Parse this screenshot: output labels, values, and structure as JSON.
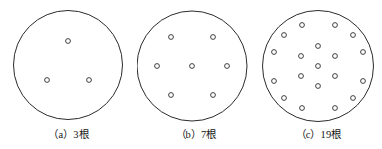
{
  "figure": {
    "background_color": "#ffffff",
    "stroke_color": "#2b2b2b",
    "text_color": "#161616",
    "panels": [
      {
        "id": "panel-a",
        "caption": "（a）3根",
        "label": "a",
        "count_text": "3根",
        "rod_count": 3,
        "circle": {
          "cx": 68,
          "cy": 65,
          "r": 54.5
        },
        "dot_radius": 2.4,
        "dots": [
          {
            "cx": 68,
            "cy": 41
          },
          {
            "cx": 47,
            "cy": 80
          },
          {
            "cx": 89,
            "cy": 80
          }
        ]
      },
      {
        "id": "panel-b",
        "caption": "（b）7根",
        "label": "b",
        "count_text": "7根",
        "rod_count": 7,
        "circle": {
          "cx": 192,
          "cy": 66,
          "r": 55
        },
        "dot_radius": 2.4,
        "dots": [
          {
            "cx": 192,
            "cy": 66
          },
          {
            "cx": 171,
            "cy": 37
          },
          {
            "cx": 213,
            "cy": 37
          },
          {
            "cx": 157,
            "cy": 66
          },
          {
            "cx": 227,
            "cy": 66
          },
          {
            "cx": 171,
            "cy": 95
          },
          {
            "cx": 213,
            "cy": 95
          }
        ]
      },
      {
        "id": "panel-c",
        "caption": "（c）19根",
        "label": "c",
        "count_text": "19根",
        "rod_count": 19,
        "circle": {
          "cx": 318,
          "cy": 66,
          "r": 55.5
        },
        "dot_radius": 2.4,
        "dots": [
          {
            "cx": 318,
            "cy": 66
          },
          {
            "cx": 318,
            "cy": 46
          },
          {
            "cx": 335,
            "cy": 56
          },
          {
            "cx": 335,
            "cy": 76
          },
          {
            "cx": 318,
            "cy": 86
          },
          {
            "cx": 301,
            "cy": 76
          },
          {
            "cx": 301,
            "cy": 56
          },
          {
            "cx": 302,
            "cy": 25
          },
          {
            "cx": 335,
            "cy": 25
          },
          {
            "cx": 284,
            "cy": 35
          },
          {
            "cx": 353,
            "cy": 35
          },
          {
            "cx": 274,
            "cy": 52
          },
          {
            "cx": 363,
            "cy": 52
          },
          {
            "cx": 274,
            "cy": 81
          },
          {
            "cx": 363,
            "cy": 81
          },
          {
            "cx": 284,
            "cy": 98
          },
          {
            "cx": 353,
            "cy": 98
          },
          {
            "cx": 302,
            "cy": 108
          },
          {
            "cx": 335,
            "cy": 108
          }
        ]
      }
    ]
  }
}
